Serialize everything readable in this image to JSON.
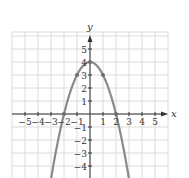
{
  "chart_data": {
    "type": "line",
    "title": "",
    "function": "y = 4 - x^2",
    "xlabel": "x",
    "ylabel": "y",
    "xlim": [
      -6,
      6
    ],
    "ylim": [
      -5,
      6
    ],
    "grid": true,
    "x_ticks": [
      -5,
      -4,
      -3,
      -2,
      -1,
      1,
      2,
      3,
      4,
      5
    ],
    "y_ticks": [
      -4,
      -3,
      -2,
      -1,
      1,
      2,
      3,
      4,
      5
    ],
    "x_tick_labels": [
      "−5",
      "−4",
      "−3",
      "−2",
      "−1",
      "1",
      "2",
      "3",
      "4",
      "5"
    ],
    "y_tick_labels": [
      "−4",
      "−3",
      "−2",
      "−1",
      "1",
      "2",
      "3",
      "4",
      "5"
    ],
    "marked_points": [
      {
        "x": -2,
        "y": 0
      },
      {
        "x": -1,
        "y": 3
      },
      {
        "x": 0,
        "y": 4
      },
      {
        "x": 1,
        "y": 3
      },
      {
        "x": 2,
        "y": 0
      }
    ],
    "series": [
      {
        "name": "y = 4 - x^2",
        "x": [
          -3,
          -2.5,
          -2,
          -1.5,
          -1,
          -0.5,
          0,
          0.5,
          1,
          1.5,
          2,
          2.5,
          3
        ],
        "y": [
          -5,
          -2.25,
          0,
          1.75,
          3,
          3.75,
          4,
          3.75,
          3,
          1.75,
          0,
          -2.25,
          -5
        ],
        "color": "#8a8a8a"
      }
    ],
    "colors": {
      "grid": "#dcdcdc",
      "axis": "#333333",
      "curve": "#8a8a8a"
    }
  }
}
